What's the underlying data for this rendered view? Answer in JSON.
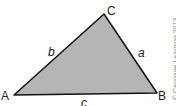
{
  "diagram": {
    "type": "triangle",
    "fill": "#b5b5b5",
    "stroke": "#111111",
    "vertices": [
      {
        "name": "A",
        "x": 14,
        "y": 95
      },
      {
        "name": "B",
        "x": 157,
        "y": 93
      },
      {
        "name": "C",
        "x": 104,
        "y": 14
      }
    ],
    "vertex_labels": {
      "A": "A",
      "B": "B",
      "C": "C"
    },
    "side_labels": {
      "a": "a",
      "b": "b",
      "c": "c"
    },
    "credit": "© Cengage Learning 2013"
  }
}
